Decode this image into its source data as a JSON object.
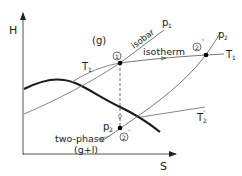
{
  "diagram": {
    "type": "H-S diagram",
    "axes": {
      "y_label": "H",
      "x_label": "S"
    },
    "region_labels": {
      "gas": "(g)",
      "two_phase": "two-phase",
      "two_phase_sub": "(g+l)"
    },
    "curve_labels": {
      "isobar": "isobar",
      "p1": "p",
      "p1_sub": "1",
      "p2_top": "p",
      "p2_top_sub": "2",
      "p2_bottom": "p",
      "p2_bottom_sub": "2",
      "isotherm": "isotherm",
      "T1_left": "T",
      "T1_left_sub": "1",
      "T1_right": "T",
      "T1_right_sub": "1",
      "T2pp": "T",
      "T2pp_sub": "2",
      "T2pp_sup": "″"
    },
    "points": [
      {
        "id": "1",
        "label": "1",
        "x": 120,
        "y": 63
      },
      {
        "id": "2prime",
        "label": "2'",
        "x": 206,
        "y": 55
      },
      {
        "id": "2doubleprime",
        "label": "2\"",
        "x": 120,
        "y": 128
      }
    ],
    "point_labels": {
      "p1": "1",
      "p2prime": "2",
      "p2prime_mark": "'",
      "p2dp": "2",
      "p2dp_mark": "″"
    },
    "colors": {
      "axis": "#555555",
      "dome": "#1a1a1a",
      "thin": "#666666",
      "point": "#000000"
    }
  }
}
